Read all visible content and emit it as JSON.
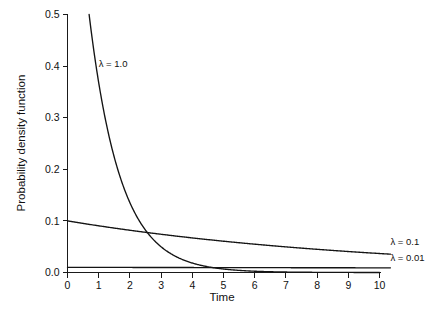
{
  "chart_data": {
    "type": "line",
    "title": "",
    "xlabel": "Time",
    "ylabel": "Probability density function",
    "xlim": [
      0,
      10
    ],
    "ylim": [
      0.0,
      0.5
    ],
    "xticks": [
      "0",
      "1",
      "2",
      "3",
      "4",
      "5",
      "6",
      "7",
      "8",
      "9",
      "10"
    ],
    "xtick_values": [
      0,
      1,
      2,
      3,
      4,
      5,
      6,
      7,
      8,
      9,
      10
    ],
    "yticks": [
      "0.0",
      "0.1",
      "0.2",
      "0.3",
      "0.4",
      "0.5"
    ],
    "ytick_values": [
      0.0,
      0.1,
      0.2,
      0.3,
      0.4,
      0.5
    ],
    "grid": false,
    "legend_position": "inline-annotations",
    "function": "exponential probability density: f(t) = lambda * exp(-lambda * t)",
    "series": [
      {
        "name": "lambda-1.0",
        "label": "λ = 1.0",
        "lambda": 1.0,
        "label_x": 1.0,
        "label_y": 0.405,
        "clipped_at_top": true,
        "x": [
          0.693,
          0.8,
          0.9,
          1.0,
          1.2,
          1.4,
          1.6,
          1.8,
          2.0,
          2.2,
          2.4,
          2.6,
          2.8,
          3.0,
          3.2,
          3.4,
          3.6,
          3.8,
          4.0,
          4.5,
          5.0,
          5.5,
          6.0,
          6.5,
          7.0,
          7.5,
          8.0,
          8.5,
          9.0,
          9.5,
          10.0
        ],
        "values": [
          0.5,
          0.449,
          0.407,
          0.368,
          0.301,
          0.247,
          0.202,
          0.165,
          0.135,
          0.111,
          0.091,
          0.074,
          0.061,
          0.05,
          0.041,
          0.033,
          0.027,
          0.022,
          0.018,
          0.011,
          0.0067,
          0.0041,
          0.0025,
          0.0015,
          0.0009,
          0.00055,
          0.00034,
          0.0002,
          0.00012,
          7e-05,
          4.5e-05
        ]
      },
      {
        "name": "lambda-0.1",
        "label": "λ = 0.1",
        "lambda": 0.1,
        "label_x": 10.35,
        "label_y": 0.0595,
        "clipped_at_top": false,
        "x": [
          0,
          0.5,
          1,
          1.5,
          2,
          2.5,
          3,
          3.5,
          4,
          4.5,
          5,
          5.5,
          6,
          6.5,
          7,
          7.5,
          8,
          8.5,
          9,
          9.5,
          10
        ],
        "values": [
          0.1,
          0.0951,
          0.0905,
          0.0861,
          0.0819,
          0.0779,
          0.0741,
          0.0705,
          0.067,
          0.0638,
          0.0607,
          0.0577,
          0.0549,
          0.0522,
          0.0497,
          0.0472,
          0.0449,
          0.0427,
          0.0407,
          0.0387,
          0.0368
        ]
      },
      {
        "name": "lambda-0.01",
        "label": "λ = 0.01",
        "lambda": 0.01,
        "label_x": 10.35,
        "label_y": 0.0285,
        "clipped_at_top": false,
        "x": [
          0,
          1,
          2,
          3,
          4,
          5,
          6,
          7,
          8,
          9,
          10
        ],
        "values": [
          0.01,
          0.0099,
          0.0098,
          0.0097,
          0.0096,
          0.0095,
          0.0094,
          0.0093,
          0.0092,
          0.0092,
          0.0091
        ]
      }
    ],
    "colors": {
      "curve": "#141414",
      "axis": "#1a1a1a",
      "background": "#ffffff",
      "text": "#111111"
    }
  }
}
